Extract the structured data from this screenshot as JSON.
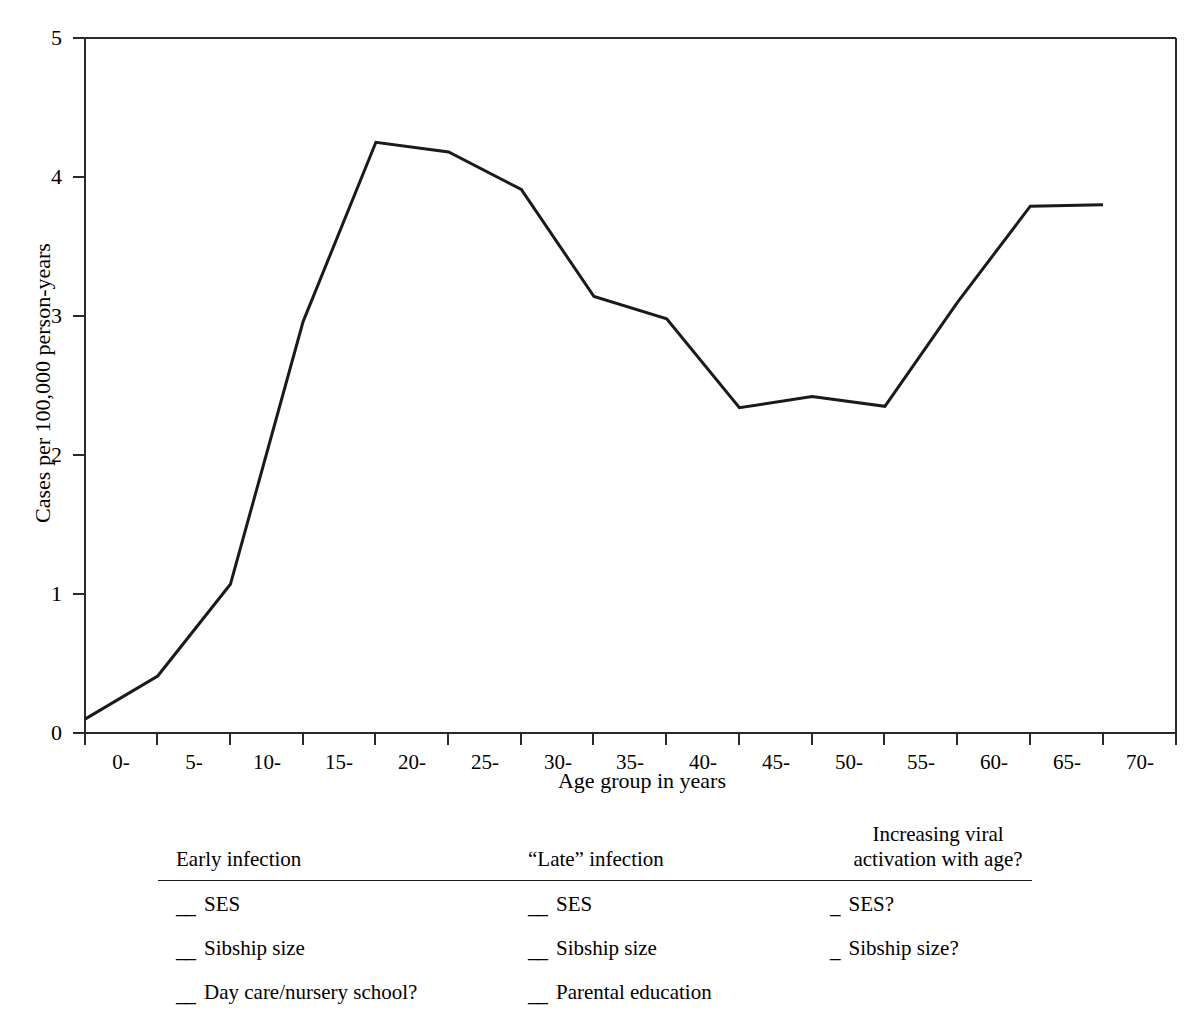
{
  "chart_data": {
    "type": "line",
    "title": "",
    "xlabel": "Age group in years",
    "ylabel": "Cases per 100,000 person-years",
    "categories": [
      "0-",
      "5-",
      "10-",
      "15-",
      "20-",
      "25-",
      "30-",
      "35-",
      "40-",
      "45-",
      "50-",
      "55-",
      "60-",
      "65-",
      "70-"
    ],
    "values": [
      0.1,
      0.41,
      1.07,
      2.96,
      4.25,
      4.18,
      3.91,
      3.14,
      2.98,
      2.34,
      2.42,
      2.35,
      3.1,
      3.79,
      3.8
    ],
    "series": [
      {
        "name": "Incidence",
        "values": [
          0.1,
          0.41,
          1.07,
          2.96,
          4.25,
          4.18,
          3.91,
          3.14,
          2.98,
          2.34,
          2.42,
          2.35,
          3.1,
          3.79,
          3.8
        ]
      }
    ],
    "ylim": [
      0,
      5
    ],
    "yticks": [
      "0",
      "1",
      "2",
      "3",
      "4",
      "5"
    ],
    "ytick_values": [
      0,
      1,
      2,
      3,
      4,
      5
    ],
    "grid": false,
    "legend": "none",
    "line_color": "#1a1a1a"
  },
  "axis": {
    "y_label": "Cases per 100,000 person-years",
    "x_label": "Age group in years",
    "y_ticks": [
      "5",
      "4",
      "3",
      "2",
      "1",
      "0"
    ],
    "x_ticks": [
      "0-",
      "5-",
      "10-",
      "15-",
      "20-",
      "25-",
      "30-",
      "35-",
      "40-",
      "45-",
      "50-",
      "55-",
      "60-",
      "65-",
      "70-"
    ]
  },
  "table": {
    "columns": [
      {
        "header_line1": "Early infection",
        "header_line2": "",
        "items": [
          {
            "mark": "__",
            "text": "SES"
          },
          {
            "mark": "__",
            "text": "Sibship size"
          },
          {
            "mark": "__",
            "text": "Day care/nursery school?"
          }
        ]
      },
      {
        "header_line1": "“Late” infection",
        "header_line2": "",
        "items": [
          {
            "mark": "__",
            "text": "SES"
          },
          {
            "mark": "__",
            "text": "Sibship size"
          },
          {
            "mark": "__",
            "text": "Parental education"
          }
        ]
      },
      {
        "header_line1": "Increasing viral",
        "header_line2": "activation with age?",
        "items": [
          {
            "mark": "_",
            "text": "SES?"
          },
          {
            "mark": "_",
            "text": "Sibship size?"
          }
        ]
      }
    ]
  }
}
